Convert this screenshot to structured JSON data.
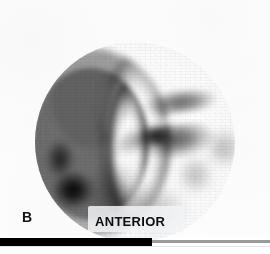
{
  "figure": {
    "panel_label": "B",
    "view_label": "ANTERIOR",
    "modality": "planar-scintigraphy",
    "colormap": "grayscale-inverted",
    "background_color": "#ffffff",
    "plate_color": "#fdfdfd",
    "ink_color": "#000000",
    "caption_backing_color": "#f2f3f4",
    "rule_heavy_color": "#000000",
    "rule_light_color": "#9a9a9a"
  },
  "scan_field": {
    "shape": "circle",
    "center_x": 135,
    "center_y": 142,
    "diameter": 200,
    "field_tint_color": "#fbfbfb"
  },
  "icons": {
    "panel_marker": "panel-letter-icon",
    "orientation_marker": "orientation-label-icon"
  },
  "uptake_regions": [
    {
      "name": "left-crescent-rim",
      "description": "broad curved band of high tracer uptake along the lower-left margin of the field of view",
      "intensity": "high",
      "peak_gray": "#0a0a0a"
    },
    {
      "name": "crescent-hot-focus",
      "description": "near-black focal hot spot at the inferior pole of the crescent",
      "intensity": "maximal",
      "peak_gray": "#050505"
    },
    {
      "name": "upper-central-band",
      "description": "horizontal band of moderate uptake superior to the central mass",
      "intensity": "moderate-high",
      "peak_gray": "#4a4a4a"
    },
    {
      "name": "cold-cleft",
      "description": "photopenic linear cleft separating the upper band from the lower mass",
      "intensity": "photopenic",
      "peak_gray": "#f4f4f4"
    },
    {
      "name": "lower-central-mass",
      "description": "larger confluent mass of uptake right of midline with a dark core",
      "intensity": "high",
      "peak_gray": "#333333"
    },
    {
      "name": "right-lateral-extension",
      "description": "faint tapering extension of activity toward the right rim",
      "intensity": "low",
      "peak_gray": "#b0b0b0"
    },
    {
      "name": "inferior-diffuse-sweep",
      "description": "diffuse mottled low-grade activity sweeping inferiorly across the lower field",
      "intensity": "low",
      "peak_gray": "#a8a8a8"
    }
  ]
}
